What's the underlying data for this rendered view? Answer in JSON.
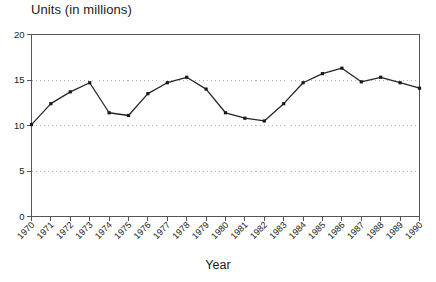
{
  "chart_data": {
    "type": "line",
    "title": "Units (in millions)",
    "xlabel": "Year",
    "ylabel": "",
    "categories": [
      "1970",
      "1971",
      "1972",
      "1973",
      "1974",
      "1975",
      "1976",
      "1977",
      "1978",
      "1979",
      "1980",
      "1981",
      "1982",
      "1983",
      "1984",
      "1985",
      "1986",
      "1987",
      "1988",
      "1989",
      "1990"
    ],
    "values": [
      10.1,
      12.4,
      13.7,
      14.7,
      11.4,
      11.1,
      13.5,
      14.7,
      15.3,
      14.0,
      11.4,
      10.8,
      10.5,
      12.4,
      14.7,
      15.7,
      16.3,
      14.8,
      15.3,
      14.7,
      14.1
    ],
    "xlim": [
      1970,
      1990
    ],
    "ylim": [
      0,
      20
    ],
    "yticks": [
      "0",
      "5",
      "10",
      "15",
      "20"
    ],
    "ytick_values": [
      0,
      5,
      10,
      15,
      20
    ],
    "grid": "horizontal-dotted",
    "gridlines_at": [
      5,
      10,
      15
    ],
    "legend": "none",
    "marker": "square",
    "line_color": "#262626",
    "marker_color": "#1a1a1a",
    "grid_color": "#b5b5b5",
    "axis_color": "#555555",
    "xtick_rotation": 45
  }
}
